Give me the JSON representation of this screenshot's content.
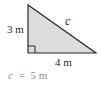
{
  "diagram": {
    "type": "right-triangle",
    "fill_color": "#dcdcdc",
    "stroke_color": "#2a2a2a",
    "vertices": {
      "top": [
        28,
        5
      ],
      "right_angle": [
        28,
        53
      ],
      "bottom_right": [
        96,
        53
      ]
    },
    "labels": {
      "vertical_leg": "3 m",
      "horizontal_leg": "4 m",
      "hypotenuse": "c"
    },
    "right_angle_marker": true
  },
  "answer": {
    "var": "c",
    "equals": "=",
    "value": "5 m",
    "text": "c = 5 m"
  }
}
